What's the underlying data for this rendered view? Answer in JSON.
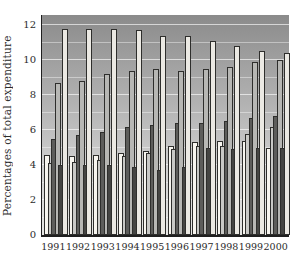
{
  "chart_data": {
    "type": "bar",
    "title": "",
    "xlabel": "",
    "ylabel": "Percentages of total expenditure",
    "ylim": [
      0,
      12.5
    ],
    "yticks": [
      0,
      2,
      4,
      6,
      8,
      10,
      12
    ],
    "grid": "white horizontal gridlines every 1 unit over gray gradient background",
    "legend_position": "none",
    "categories": [
      "1991",
      "1992",
      "1993",
      "1994",
      "1995",
      "1996",
      "1997",
      "1998",
      "1999",
      "2000"
    ],
    "series": [
      {
        "name": "series-1-white-short",
        "color": "#f7f5ef",
        "values": [
          4.6,
          4.5,
          4.6,
          4.7,
          4.8,
          5.1,
          5.3,
          5.4,
          5.4,
          5.0
        ]
      },
      {
        "name": "series-2-light-gray",
        "color": "#c9c9c6",
        "values": [
          4.1,
          4.2,
          4.3,
          4.5,
          4.7,
          4.9,
          5.1,
          5.1,
          5.8,
          6.2
        ]
      },
      {
        "name": "series-3-dark-gray",
        "color": "#5d5d5b",
        "values": [
          5.5,
          5.7,
          5.9,
          6.2,
          6.3,
          6.4,
          6.4,
          6.5,
          6.7,
          6.8
        ]
      },
      {
        "name": "series-4-medium-gray-tall",
        "color": "#b7b7b4",
        "values": [
          8.7,
          8.8,
          9.2,
          9.4,
          9.5,
          9.4,
          9.5,
          9.6,
          9.9,
          10.0
        ]
      },
      {
        "name": "series-5-darkest-short",
        "color": "#454543",
        "values": [
          4.0,
          4.0,
          4.0,
          3.9,
          3.7,
          3.9,
          5.0,
          4.9,
          5.0,
          5.0
        ]
      },
      {
        "name": "series-6-pale-tall",
        "color": "#ebe9e3",
        "values": [
          11.8,
          11.8,
          11.8,
          11.7,
          11.4,
          11.4,
          11.1,
          10.8,
          10.5,
          10.4
        ]
      }
    ]
  },
  "style": {
    "bar_outline": "#2e2e2c",
    "axis_color": "#1f1f1f",
    "plot_bg_top": "#8b8b8b",
    "plot_bg_bottom": "#e7e7e5",
    "gridline_color": "#ffffff"
  }
}
